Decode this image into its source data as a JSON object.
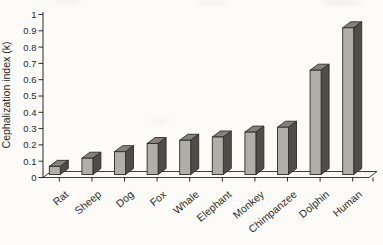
{
  "chart_data": {
    "type": "bar",
    "style": "3d-column",
    "title": "",
    "xlabel": "",
    "ylabel": "Cephalization index (k)",
    "categories": [
      "Rat",
      "Sheep",
      "Dog",
      "Fox",
      "Whale",
      "Elephant",
      "Monkey",
      "Chimpanzee",
      "Dolphin",
      "Human"
    ],
    "values": [
      0.05,
      0.1,
      0.14,
      0.19,
      0.21,
      0.23,
      0.26,
      0.29,
      0.64,
      0.9
    ],
    "ylim": [
      0,
      1
    ],
    "ytick_step": 0.1,
    "ytick_labels": [
      "0",
      "0.1",
      "0.2",
      "0.3",
      "0.4",
      "0.5",
      "0.6",
      "0.7",
      "0.8",
      "0.9",
      "1"
    ],
    "grid": false,
    "legend": "none",
    "label_rotation_deg": -40,
    "colors": {
      "background": "#fcfbf8",
      "bar_front": "#b1ada7",
      "bar_top": "#87817a",
      "bar_side": "#524c46",
      "outline": "#2f2c29",
      "axis": "#2b2927",
      "text": "#2b2927"
    }
  }
}
